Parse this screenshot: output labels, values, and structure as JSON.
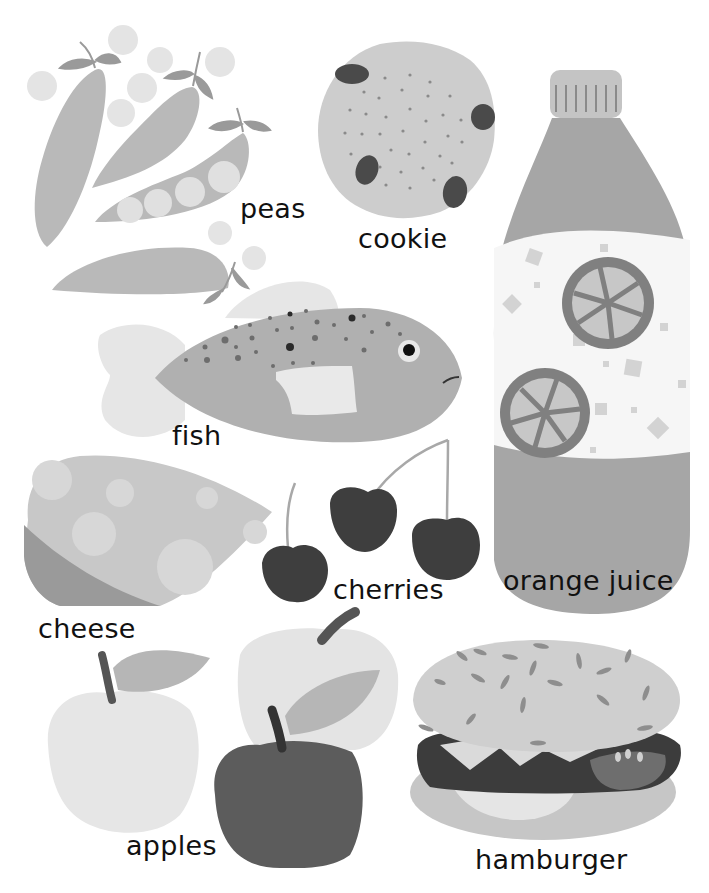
{
  "page": {
    "background": "#ffffff",
    "text_color": "#111111"
  },
  "items": [
    {
      "id": "peas",
      "label": "peas"
    },
    {
      "id": "cookie",
      "label": "cookie"
    },
    {
      "id": "orange_juice",
      "label": "orange juice"
    },
    {
      "id": "fish",
      "label": "fish"
    },
    {
      "id": "cheese",
      "label": "cheese"
    },
    {
      "id": "cherries",
      "label": "cherries"
    },
    {
      "id": "apples",
      "label": "apples"
    },
    {
      "id": "hamburger",
      "label": "hamburger"
    }
  ],
  "palette": {
    "light": "#e2e2e2",
    "mid_light": "#cfcfcf",
    "mid": "#b8b8b8",
    "mid_dark": "#9a9a9a",
    "dark": "#7d7d7d",
    "darker": "#5e5e5e",
    "darkest": "#3a3a3a"
  }
}
